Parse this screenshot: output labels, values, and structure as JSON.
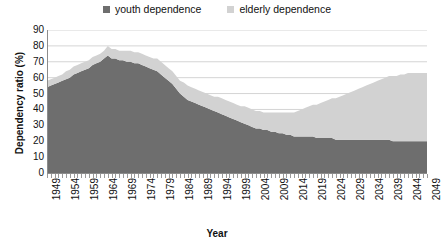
{
  "legend": {
    "position": "top-center",
    "items": [
      {
        "label": "youth dependence",
        "color": "#6e6e6e",
        "icon": "square-swatch-icon"
      },
      {
        "label": "elderly dependence",
        "color": "#d2d2d2",
        "icon": "square-swatch-icon"
      }
    ]
  },
  "axes": {
    "ylabel": "Dependency ratio (%)",
    "xlabel": "Year",
    "yticks": [
      "0",
      "10",
      "20",
      "30",
      "40",
      "50",
      "60",
      "70",
      "80",
      "90"
    ],
    "xticks": [
      "1949",
      "1954",
      "1959",
      "1964",
      "1969",
      "1974",
      "1979",
      "1984",
      "1989",
      "1994",
      "1999",
      "2004",
      "2009",
      "2014",
      "2019",
      "2024",
      "2029",
      "2034",
      "2039",
      "2044",
      "2049"
    ]
  },
  "chart_data": {
    "type": "area",
    "stacked": true,
    "title": "",
    "xlabel": "Year",
    "ylabel": "Dependency ratio (%)",
    "xlim": [
      1949,
      2049
    ],
    "ylim": [
      0,
      90
    ],
    "grid": "horizontal",
    "legend_position": "top-center",
    "x": [
      1949,
      1950,
      1951,
      1952,
      1953,
      1954,
      1955,
      1956,
      1957,
      1958,
      1959,
      1960,
      1961,
      1962,
      1963,
      1964,
      1965,
      1966,
      1967,
      1968,
      1969,
      1970,
      1971,
      1972,
      1973,
      1974,
      1975,
      1976,
      1977,
      1978,
      1979,
      1980,
      1981,
      1982,
      1983,
      1984,
      1985,
      1986,
      1987,
      1988,
      1989,
      1990,
      1991,
      1992,
      1993,
      1994,
      1995,
      1996,
      1997,
      1998,
      1999,
      2000,
      2001,
      2002,
      2003,
      2004,
      2005,
      2006,
      2007,
      2008,
      2009,
      2010,
      2011,
      2012,
      2013,
      2014,
      2015,
      2016,
      2017,
      2018,
      2019,
      2020,
      2021,
      2022,
      2023,
      2024,
      2025,
      2026,
      2027,
      2028,
      2029,
      2030,
      2031,
      2032,
      2033,
      2034,
      2035,
      2036,
      2037,
      2038,
      2039,
      2040,
      2041,
      2042,
      2043,
      2044,
      2045,
      2046,
      2047,
      2048,
      2049
    ],
    "series": [
      {
        "name": "youth dependence",
        "color": "#6e6e6e",
        "values": [
          54,
          55,
          56,
          57,
          58,
          59,
          60,
          62,
          63,
          64,
          65,
          66,
          68,
          69,
          70,
          72,
          74,
          72,
          72,
          71,
          71,
          70,
          70,
          69,
          69,
          68,
          67,
          66,
          65,
          64,
          62,
          60,
          58,
          56,
          53,
          50,
          48,
          46,
          45,
          44,
          43,
          42,
          41,
          40,
          39,
          38,
          37,
          36,
          35,
          34,
          33,
          32,
          31,
          30,
          29,
          28,
          28,
          27,
          27,
          26,
          26,
          25,
          25,
          24,
          24,
          23,
          23,
          23,
          23,
          23,
          23,
          22,
          22,
          22,
          22,
          22,
          21,
          21,
          21,
          21,
          21,
          21,
          21,
          21,
          21,
          21,
          21,
          21,
          21,
          21,
          21,
          20,
          20,
          20,
          20,
          20,
          20,
          20,
          20,
          20,
          20
        ]
      },
      {
        "name": "elderly dependence",
        "color": "#d2d2d2",
        "values": [
          4,
          4,
          4,
          4,
          4,
          5,
          5,
          5,
          5,
          5,
          5,
          5,
          5,
          5,
          5,
          5,
          6,
          6,
          6,
          6,
          6,
          7,
          7,
          7,
          7,
          7,
          7,
          7,
          7,
          8,
          8,
          8,
          8,
          8,
          8,
          8,
          9,
          9,
          9,
          9,
          9,
          9,
          9,
          9,
          9,
          10,
          10,
          10,
          10,
          10,
          10,
          10,
          11,
          11,
          11,
          11,
          11,
          11,
          11,
          12,
          12,
          13,
          13,
          14,
          14,
          15,
          16,
          17,
          18,
          19,
          20,
          21,
          22,
          23,
          24,
          25,
          26,
          27,
          28,
          29,
          30,
          31,
          32,
          33,
          34,
          35,
          36,
          37,
          38,
          39,
          40,
          41,
          41,
          42,
          42,
          43,
          43,
          43,
          43,
          43,
          43
        ]
      }
    ],
    "total": [
      58,
      59,
      60,
      61,
      62,
      64,
      65,
      67,
      68,
      69,
      70,
      71,
      73,
      74,
      75,
      77,
      80,
      78,
      78,
      77,
      77,
      77,
      77,
      76,
      76,
      75,
      74,
      73,
      72,
      72,
      70,
      68,
      66,
      64,
      61,
      58,
      57,
      55,
      54,
      53,
      52,
      51,
      50,
      49,
      48,
      48,
      47,
      46,
      45,
      44,
      43,
      42,
      42,
      41,
      40,
      39,
      39,
      38,
      38,
      38,
      38,
      38,
      38,
      38,
      38,
      38,
      39,
      40,
      41,
      42,
      43,
      43,
      44,
      45,
      46,
      47,
      47,
      48,
      49,
      50,
      51,
      52,
      53,
      54,
      55,
      56,
      57,
      58,
      59,
      60,
      61,
      61,
      61,
      62,
      62,
      63,
      63,
      63,
      63,
      63,
      63
    ]
  }
}
